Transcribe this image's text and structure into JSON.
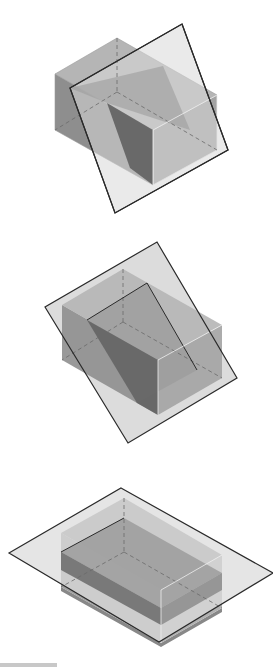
{
  "figures": [
    {
      "id": "figure-1",
      "description": "Rectangular box intersected by an oblique plane (steep tilt)",
      "plane": {
        "points": "182,24 228,150 115,213 70,88",
        "fill": "#d9d9d9",
        "stroke": "#2a2a2a"
      },
      "box": {
        "top_face": "117,38 217,95 153,130 55,74",
        "left_face": "55,74 153,130 153,185 55,130",
        "right_face": "153,130 217,95 217,150 153,185"
      },
      "cut_section": "70,88 163,66 190,130 107,103",
      "dark_face": "107,103 153,130 153,185 130,168",
      "hidden_edges": [
        [
          117,
          38,
          117,
          92
        ],
        [
          117,
          92,
          55,
          130
        ],
        [
          117,
          92,
          217,
          150
        ]
      ]
    },
    {
      "id": "figure-2",
      "description": "Rectangular box intersected by an oblique plane (moderate tilt)",
      "plane": {
        "points": "157,242 237,378 128,443 45,307",
        "fill": "#d9d9d9",
        "stroke": "#2a2a2a"
      },
      "box": {
        "top_face": "123,269 222,325 158,360 62,305",
        "left_face": "62,305 158,360 158,415 62,360",
        "right_face": "158,360 222,325 222,378 158,415"
      },
      "cut_section": "87,320 147,283 197,370 137,403",
      "dark_face": "87,320 137,403 158,415 158,360",
      "hidden_edges": [
        [
          123,
          269,
          123,
          322
        ],
        [
          123,
          322,
          62,
          360
        ],
        [
          123,
          322,
          222,
          378
        ]
      ]
    },
    {
      "id": "figure-3",
      "description": "Rectangular box intersected by a horizontal plane",
      "plane": {
        "points": "121,488 273,573 159,642 9,553",
        "fill": "#d9d9d9",
        "stroke": "#2a2a2a"
      },
      "box": {
        "top_face": "124,498 222,555 161,590 61,533",
        "left_face": "61,533 161,590 161,643 61,587",
        "right_face": "161,590 222,555 222,608 161,643"
      },
      "cut_section": "61,552 124,518 222,573 161,608",
      "dark_face": "61,552 161,608 161,625 61,570",
      "hidden_edges": [
        [
          124,
          498,
          124,
          552
        ],
        [
          124,
          552,
          61,
          587
        ],
        [
          124,
          552,
          222,
          608
        ]
      ]
    }
  ],
  "colors": {
    "plane_fill": "#d9d9d9",
    "box_top": "#b5b5b5",
    "box_left": "#8e8e8e",
    "box_right": "#a3a3a3",
    "section": "#9c9c9c",
    "dark_face": "#5c5c5c",
    "edge": "#2a2a2a",
    "hidden_edge": "#6a6a6a"
  },
  "scalebar": {
    "visible": true
  }
}
